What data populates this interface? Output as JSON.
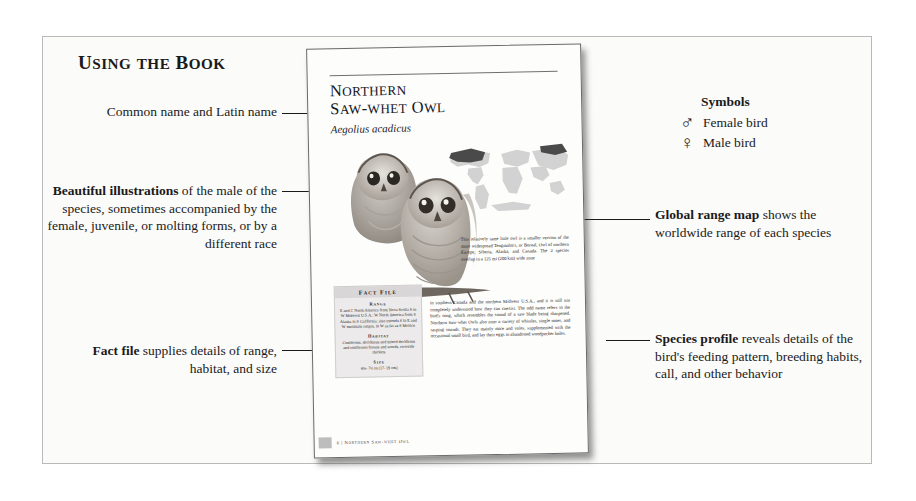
{
  "section_title": "Using the Book",
  "annotations": {
    "common_name": {
      "bold": "",
      "text": "Common name and Latin name"
    },
    "illustrations": {
      "bold": "Beautiful illustrations",
      "text": " of the male of the species, sometimes accompanied by the female, juvenile, or molting forms, or by a different race"
    },
    "fact_file": {
      "bold": "Fact file",
      "text": " supplies details of range, habitat, and size"
    },
    "range_map": {
      "bold": "Global range map",
      "text": " shows the worldwide range of each species"
    },
    "species_profile": {
      "bold": "Species profile",
      "text": " reveals details of the bird's feeding pattern, breeding habits, call, and other behavior"
    }
  },
  "symbols": {
    "title": "Symbols",
    "items": [
      {
        "glyph": "♂",
        "icon": "mars-symbol-icon",
        "label": "Female bird"
      },
      {
        "glyph": "♀",
        "icon": "venus-symbol-icon",
        "label": "Male bird"
      }
    ]
  },
  "book_page": {
    "name_line1": "Northern",
    "name_line2": "Saw-whet Owl",
    "latin_name": "Aegolius acadicus",
    "fact_file": {
      "title": "Fact File",
      "entries": [
        {
          "heading": "Range",
          "body": "E and C North America from Nova Scotia S to W Midwest U.S.A.; W North America from S Alaska to S California; also extends S in E and W mountain ranges, in W as far as S Mexico"
        },
        {
          "heading": "Habitat",
          "body": "Coniferous, deciduous and mixed deciduous and coniferous forests and woods, riverside thickets"
        },
        {
          "heading": "Size",
          "body": "6¾–7½ in (17–19 cm)"
        }
      ]
    },
    "profile_dropcap": "T",
    "profile_text_1": "his relatively tame little owl is a smaller version of the more widespread Tengmalm's, or Boreal, Owl of northern Europe, Siberia, Alaska, and Canada. The 2 species overlap in a 125 mi (200 km) wide zone",
    "profile_text_2": "in southern Canada and the northern Midwest U.S.A., and it is still not completely understood how they can coexist. The odd name refers to the bird's song, which resembles the sound of a saw blade being sharpened. Northern Saw-whet Owls also utter a variety of whistles, single notes, and rasping sounds. They eat mainly mice and voles, supplemented with the occasional small bird, and lay their eggs in abandoned woodpecker holes.",
    "footer": "6 | Northern Saw-whet Owl"
  },
  "colors": {
    "ink": "#1a1a1a",
    "page": "#fdfdfc",
    "factfile_bg": "#eceaea",
    "map_land": "#cfcfcf",
    "map_range": "#4a4a4a",
    "frame_border": "#b9b9b9"
  }
}
